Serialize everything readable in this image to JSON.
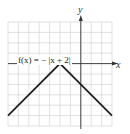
{
  "chart_data": {
    "type": "line",
    "title": "",
    "function_label": "f(x) = − |x + 2|",
    "xlabel": "x",
    "ylabel": "y",
    "xlim": [
      -7,
      3
    ],
    "ylim": [
      -6,
      4
    ],
    "grid": true,
    "grid_step": 1,
    "series": [
      {
        "name": "f(x) = −|x + 2|",
        "x": [
          -7,
          -2,
          3
        ],
        "y": [
          -5,
          0,
          -5
        ]
      }
    ],
    "vertex": [
      -2,
      0
    ]
  },
  "colors": {
    "grid": "#d4d4d4",
    "axis": "#333333",
    "curve": "#222222"
  }
}
